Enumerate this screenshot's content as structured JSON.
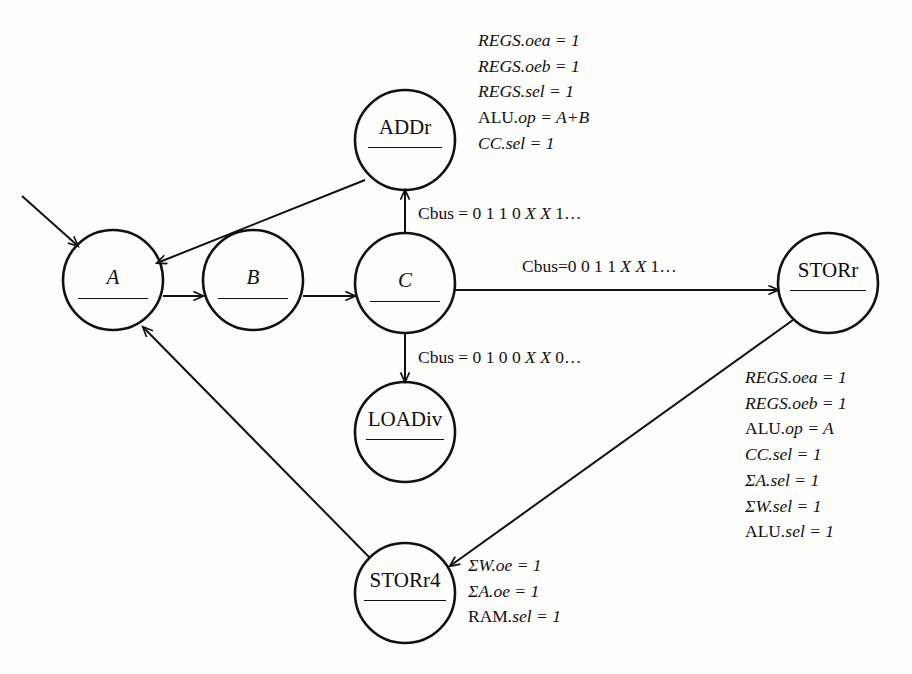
{
  "diagram": {
    "stroke_color": "#111111",
    "background_color": "#fdfdfc",
    "states": [
      {
        "id": "A",
        "label": "A",
        "style": "italic",
        "cx": 113,
        "cy": 280,
        "r": 50,
        "rule_width": 70
      },
      {
        "id": "B",
        "label": "B",
        "style": "italic",
        "cx": 253,
        "cy": 280,
        "r": 50,
        "rule_width": 70
      },
      {
        "id": "C",
        "label": "C",
        "style": "italic",
        "cx": 405,
        "cy": 283,
        "r": 50,
        "rule_width": 70
      },
      {
        "id": "ADDr",
        "label": "ADDr",
        "style": "roman",
        "cx": 405,
        "cy": 140,
        "r": 50,
        "rule_width": 74
      },
      {
        "id": "LOADiv",
        "label": "LOADiv",
        "style": "roman",
        "cx": 405,
        "cy": 432,
        "r": 50,
        "rule_width": 78
      },
      {
        "id": "STORr",
        "label": "STORr",
        "style": "roman",
        "cx": 828,
        "cy": 283,
        "r": 50,
        "rule_width": 76
      },
      {
        "id": "STORr4",
        "label": "STORr4",
        "style": "roman",
        "cx": 405,
        "cy": 593,
        "r": 50,
        "rule_width": 82
      }
    ],
    "edge_labels": [
      {
        "id": "c-to-addr",
        "text_parts": [
          "Cbus = 0 1 1 0 ",
          "X X",
          " 1…"
        ],
        "x": 418,
        "y": 205
      },
      {
        "id": "c-to-storr",
        "text_parts": [
          "Cbus=0 0 1 1 ",
          "X X",
          " 1…"
        ],
        "x": 522,
        "y": 258
      },
      {
        "id": "c-to-loadiv",
        "text_parts": [
          "Cbus = 0 1 0 0 ",
          "X X",
          " 0…"
        ],
        "x": 418,
        "y": 349
      }
    ],
    "annotations": {
      "addr": {
        "id": "addr-actions",
        "x": 478,
        "y": 28,
        "lines": [
          {
            "head": "REGS",
            "head_style": "it",
            "tail": ".oea = 1",
            "tail_style": "it"
          },
          {
            "head": "REGS",
            "head_style": "it",
            "tail": ".oeb = 1",
            "tail_style": "it"
          },
          {
            "head": "REGS",
            "head_style": "it",
            "tail": ".sel = 1",
            "tail_style": "it"
          },
          {
            "head": "ALU",
            "head_style": "rm",
            "tail": ".op = A+B",
            "tail_style": "it"
          },
          {
            "head": "CC",
            "head_style": "it",
            "tail": ".sel = 1",
            "tail_style": "it"
          }
        ]
      },
      "storr": {
        "id": "storr-actions",
        "x": 745,
        "y": 365,
        "lines": [
          {
            "head": "REGS",
            "head_style": "it",
            "tail": ".oea = 1",
            "tail_style": "it"
          },
          {
            "head": "REGS",
            "head_style": "it",
            "tail": ".oeb = 1",
            "tail_style": "it"
          },
          {
            "head": "ALU",
            "head_style": "rm",
            "tail": ".op = A",
            "tail_style": "it"
          },
          {
            "head": "CC",
            "head_style": "it",
            "tail": ".sel = 1",
            "tail_style": "it"
          },
          {
            "head": "ΣA",
            "head_style": "it",
            "tail": ".sel = 1",
            "tail_style": "it"
          },
          {
            "head": "ΣW",
            "head_style": "it",
            "tail": ".sel = 1",
            "tail_style": "it"
          },
          {
            "head": "ALU",
            "head_style": "rm",
            "tail": ".sel = 1",
            "tail_style": "it"
          }
        ]
      },
      "storr4": {
        "id": "storr4-actions",
        "x": 468,
        "y": 553,
        "lines": [
          {
            "head": "ΣW",
            "head_style": "it",
            "tail": ".oe = 1",
            "tail_style": "it"
          },
          {
            "head": "ΣA",
            "head_style": "it",
            "tail": ".oe = 1",
            "tail_style": "it"
          },
          {
            "head": "RAM",
            "head_style": "rm",
            "tail": ".sel = 1",
            "tail_style": "it"
          }
        ]
      }
    },
    "transitions": [
      {
        "id": "start-to-A",
        "from": "start",
        "to": "A"
      },
      {
        "id": "A-to-B",
        "from": "A",
        "to": "B"
      },
      {
        "id": "B-to-C",
        "from": "B",
        "to": "C"
      },
      {
        "id": "C-to-ADDr",
        "from": "C",
        "to": "ADDr"
      },
      {
        "id": "C-to-LOADiv",
        "from": "C",
        "to": "LOADiv"
      },
      {
        "id": "C-to-STORr",
        "from": "C",
        "to": "STORr"
      },
      {
        "id": "ADDr-to-A",
        "from": "ADDr",
        "to": "A"
      },
      {
        "id": "STORr-to-STORr4",
        "from": "STORr",
        "to": "STORr4"
      },
      {
        "id": "STORr4-to-A",
        "from": "STORr4",
        "to": "A"
      }
    ]
  }
}
